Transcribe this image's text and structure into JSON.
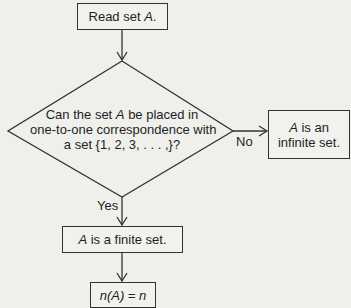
{
  "diagram": {
    "type": "flowchart",
    "nodes": [
      {
        "id": "start",
        "shape": "process",
        "text_plain": "Read set ",
        "text_var": "A",
        "text_end": "."
      },
      {
        "id": "decision",
        "shape": "decision",
        "lines": [
          {
            "pre": "Can the set ",
            "var": "A",
            "post": " be placed in"
          },
          {
            "pre": "one-to-one correspondence with",
            "var": "",
            "post": ""
          },
          {
            "pre": "a set {1, 2, 3, . . . ,}?",
            "var": "",
            "post": ""
          }
        ]
      },
      {
        "id": "infinite",
        "shape": "process",
        "line1_var": "A",
        "line1_post": " is an",
        "line2": "infinite set."
      },
      {
        "id": "finite",
        "shape": "process",
        "var": "A",
        "post": " is a finite set."
      },
      {
        "id": "count",
        "shape": "process",
        "text": "n(A) = n"
      }
    ],
    "edges": [
      {
        "from": "start",
        "to": "decision",
        "label": ""
      },
      {
        "from": "decision",
        "to": "infinite",
        "label": "No"
      },
      {
        "from": "decision",
        "to": "finite",
        "label": "Yes"
      },
      {
        "from": "finite",
        "to": "count",
        "label": ""
      }
    ],
    "labels": {
      "no": "No",
      "yes": "Yes"
    },
    "colors": {
      "background": "#efefeb",
      "stroke": "#333333",
      "text": "#1e1e1e"
    }
  }
}
